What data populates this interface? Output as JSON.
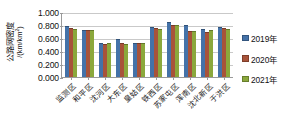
{
  "chart_data": {
    "type": "bar",
    "title": "",
    "xlabel": "",
    "ylabel_line1": "公路网密度",
    "ylabel_line2_prefix": "/(km/km",
    "ylabel_line2_sup": "2",
    "ylabel_line2_suffix": ")",
    "ylim": [
      0,
      1.0
    ],
    "ytick_values": [
      1.0,
      0.8,
      0.6,
      0.4,
      0.2,
      0.0
    ],
    "ytick_labels": [
      "1.000",
      "0.800",
      "0.600",
      "0.400",
      "0.200",
      "0.000"
    ],
    "grid": true,
    "grid_axis": "y",
    "legend_position": "right",
    "categories": [
      "监测区",
      "和平区",
      "沈河区",
      "大东区",
      "皇姑区",
      "铁西区",
      "苏家屯区",
      "浑南区",
      "沈北新区",
      "于洪区"
    ],
    "series": [
      {
        "name": "2019年",
        "color": "#4472a8",
        "values": [
          0.785,
          0.73,
          0.52,
          0.59,
          0.525,
          0.775,
          0.84,
          0.795,
          0.735,
          0.765
        ]
      },
      {
        "name": "2020年",
        "color": "#a8533a",
        "values": [
          0.75,
          0.725,
          0.515,
          0.525,
          0.525,
          0.76,
          0.795,
          0.715,
          0.7,
          0.75
        ]
      },
      {
        "name": "2021年",
        "color": "#8ba83c",
        "values": [
          0.745,
          0.72,
          0.52,
          0.515,
          0.53,
          0.745,
          0.795,
          0.715,
          0.73,
          0.745
        ]
      }
    ]
  },
  "legend": {
    "items": [
      {
        "label": "2019年",
        "color": "#4472a8"
      },
      {
        "label": "2020年",
        "color": "#a8533a"
      },
      {
        "label": "2021年",
        "color": "#8ba83c"
      }
    ]
  }
}
